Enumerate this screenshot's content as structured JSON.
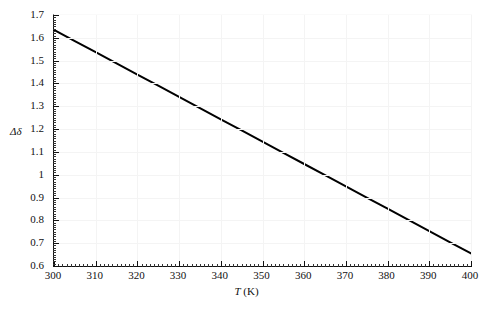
{
  "chart_data": {
    "type": "line",
    "title": "",
    "xlabel": "T (K)",
    "ylabel": "Δδ",
    "xlim": [
      300,
      400
    ],
    "ylim": [
      0.6,
      1.7
    ],
    "grid": true,
    "legend": "none",
    "x_major_step": 10,
    "x_minor_step": 1,
    "y_major_step": 0.1,
    "y_minor_step": 0.01,
    "xticks": [
      "300",
      "310",
      "320",
      "330",
      "340",
      "350",
      "360",
      "370",
      "380",
      "390",
      "400"
    ],
    "xtick_values": [
      300,
      310,
      320,
      330,
      340,
      350,
      360,
      370,
      380,
      390,
      400
    ],
    "yticks": [
      "0.6",
      "0.7",
      "0.8",
      "0.9",
      "1",
      "1.1",
      "1.2",
      "1.3",
      "1.4",
      "1.5",
      "1.6",
      "1.7"
    ],
    "ytick_values": [
      0.6,
      0.7,
      0.8,
      0.9,
      1.0,
      1.1,
      1.2,
      1.3,
      1.4,
      1.5,
      1.6,
      1.7
    ],
    "series": [
      {
        "name": "Δδ(T)",
        "color": "#000000",
        "linewidth": 2.0,
        "x": [
          300,
          305,
          310,
          315,
          320,
          325,
          330,
          335,
          340,
          345,
          350,
          355,
          360,
          365,
          370,
          375,
          380,
          385,
          390,
          395,
          400
        ],
        "values": [
          1.635,
          1.586,
          1.537,
          1.488,
          1.439,
          1.39,
          1.341,
          1.292,
          1.243,
          1.194,
          1.145,
          1.096,
          1.047,
          0.998,
          0.949,
          0.9,
          0.851,
          0.802,
          0.753,
          0.704,
          0.655
        ]
      }
    ],
    "annotations": []
  },
  "axes": {
    "x_axis_title_symbol": "T",
    "x_axis_title_unit": " (K)",
    "y_axis_title": "Δδ"
  },
  "colors": {
    "line": "#000000",
    "axis": "#111111",
    "grid": "#f4f4f4",
    "background": "#ffffff",
    "frame_light": "#fafafa"
  }
}
